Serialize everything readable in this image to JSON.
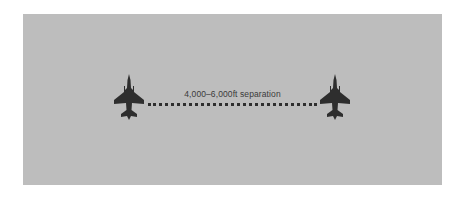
{
  "diagram": {
    "label": "4,000–6,000ft separation",
    "colors": {
      "background": "#bdbdbd",
      "aircraft": "#2e2e2e",
      "line": "#2e2e2e",
      "text": "#3a3a3a"
    },
    "aircraft": [
      {
        "id": "left",
        "icon": "fighter-jet-icon"
      },
      {
        "id": "right",
        "icon": "fighter-jet-icon"
      }
    ],
    "connector": "dotted-line"
  }
}
